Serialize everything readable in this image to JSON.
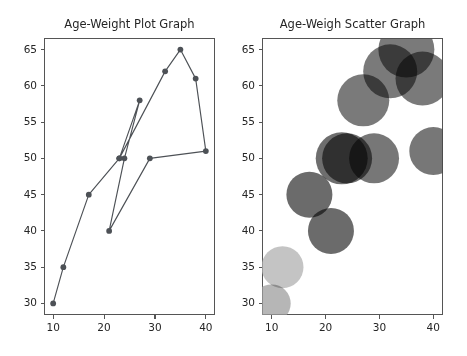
{
  "figure": {
    "width": 467,
    "height": 356,
    "background": "#ffffff",
    "line_color": "#4d5156",
    "frame_color": "#555555",
    "text_color": "#262626"
  },
  "chart_data": [
    {
      "type": "line",
      "title": "Age-Weight Plot Graph",
      "xlabel": "",
      "ylabel": "",
      "xlim": [
        8.2,
        41.8
      ],
      "ylim": [
        28.4,
        66.6
      ],
      "xticks": [
        10,
        20,
        30,
        40
      ],
      "yticks": [
        30,
        35,
        40,
        45,
        50,
        55,
        60,
        65
      ],
      "grid": false,
      "legend": "none",
      "marker": "o",
      "marker_size": 5,
      "color": "#4d5156",
      "x": [
        10,
        12,
        17,
        23,
        27,
        24,
        21,
        29,
        40,
        38,
        35,
        32,
        23
      ],
      "y": [
        30,
        35,
        45,
        50,
        58,
        50,
        40,
        50,
        51,
        61,
        65,
        62,
        50
      ],
      "points": [
        {
          "age": 10,
          "weight": 30
        },
        {
          "age": 12,
          "weight": 35
        },
        {
          "age": 17,
          "weight": 45
        },
        {
          "age": 23,
          "weight": 50
        },
        {
          "age": 27,
          "weight": 58
        },
        {
          "age": 24,
          "weight": 50
        },
        {
          "age": 21,
          "weight": 40
        },
        {
          "age": 29,
          "weight": 50
        },
        {
          "age": 40,
          "weight": 51
        },
        {
          "age": 38,
          "weight": 61
        },
        {
          "age": 35,
          "weight": 65
        },
        {
          "age": 32,
          "weight": 62
        },
        {
          "age": 23,
          "weight": 50
        }
      ]
    },
    {
      "type": "scatter",
      "title": "Age-Weigh Scatter Graph",
      "xlabel": "",
      "ylabel": "",
      "xlim": [
        8.2,
        41.8
      ],
      "ylim": [
        28.4,
        66.6
      ],
      "xticks": [
        10,
        20,
        30,
        40
      ],
      "yticks": [
        30,
        35,
        40,
        45,
        50,
        55,
        60,
        65
      ],
      "grid": false,
      "legend": "none",
      "alpha": 0.75,
      "points": [
        {
          "age": 10,
          "weight": 30,
          "size": 19,
          "color": "#9e9e9e"
        },
        {
          "age": 12,
          "weight": 35,
          "size": 21,
          "color": "#b0b0b0"
        },
        {
          "age": 17,
          "weight": 45,
          "size": 23,
          "color": "#3a3a3a"
        },
        {
          "age": 21,
          "weight": 40,
          "size": 23,
          "color": "#3a3a3a"
        },
        {
          "age": 23,
          "weight": 50,
          "size": 26,
          "color": "#3d3d3d"
        },
        {
          "age": 24,
          "weight": 50,
          "size": 25,
          "color": "#3f3f3f"
        },
        {
          "age": 29,
          "weight": 50,
          "size": 25,
          "color": "#4a4a4a"
        },
        {
          "age": 27,
          "weight": 58,
          "size": 26,
          "color": "#4e4e4e"
        },
        {
          "age": 32,
          "weight": 62,
          "size": 27,
          "color": "#4e4e4e"
        },
        {
          "age": 35,
          "weight": 65,
          "size": 28,
          "color": "#4e4e4e"
        },
        {
          "age": 38,
          "weight": 61,
          "size": 27,
          "color": "#4e4e4e"
        },
        {
          "age": 40,
          "weight": 51,
          "size": 24,
          "color": "#4a4a4a"
        }
      ]
    }
  ],
  "axes_geometry": [
    {
      "name": "left",
      "left": 44,
      "top": 38,
      "width": 171,
      "height": 277
    },
    {
      "name": "right",
      "left": 262,
      "top": 38,
      "width": 181,
      "height": 277
    }
  ]
}
